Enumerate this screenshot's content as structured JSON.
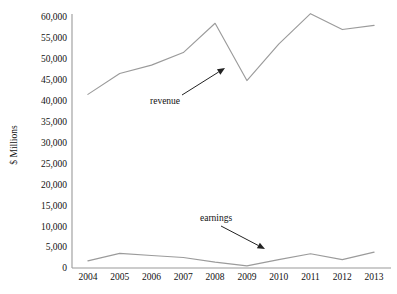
{
  "chart_data": {
    "type": "line",
    "title": "",
    "subtitle": "",
    "xlabel": "",
    "ylabel": "$ Millions",
    "categories": [
      "2004",
      "2005",
      "2006",
      "2007",
      "2008",
      "2009",
      "2010",
      "2011",
      "2012",
      "2013"
    ],
    "x": [
      2004,
      2005,
      2006,
      2007,
      2008,
      2009,
      2010,
      2011,
      2012,
      2013
    ],
    "series": [
      {
        "name": "revenue",
        "values": [
          41500,
          46500,
          48500,
          51500,
          58500,
          44800,
          53500,
          60800,
          57000,
          58000
        ],
        "color": "#9b9b9b"
      },
      {
        "name": "earnings",
        "values": [
          1700,
          3500,
          3000,
          2500,
          1400,
          500,
          2000,
          3400,
          2000,
          3800
        ],
        "color": "#9b9b9b"
      }
    ],
    "ylim": [
      0,
      60000
    ],
    "xlim": [
      2004,
      2013
    ],
    "yticks": [
      0,
      5000,
      10000,
      15000,
      20000,
      25000,
      30000,
      35000,
      40000,
      45000,
      50000,
      55000,
      60000
    ],
    "ytick_labels": [
      "0",
      "5,000",
      "10,000",
      "15,000",
      "20,000",
      "25,000",
      "30,000",
      "35,000",
      "40,000",
      "45,000",
      "50,000",
      "55,000",
      "60,000"
    ],
    "xtick_labels": [
      "2004",
      "2005",
      "2006",
      "2007",
      "2008",
      "2009",
      "2010",
      "2011",
      "2012",
      "2013"
    ],
    "grid": false,
    "legend": "none",
    "annotations": [
      {
        "text": "revenue",
        "label_x": 150,
        "label_y": 104,
        "arrow_from_x": 182,
        "arrow_from_y": 95,
        "arrow_to_x": 225,
        "arrow_to_y": 68
      },
      {
        "text": "earnings",
        "label_x": 200,
        "label_y": 221,
        "arrow_from_x": 221,
        "arrow_from_y": 226,
        "arrow_to_x": 265,
        "arrow_to_y": 249
      }
    ]
  },
  "axes": {
    "y_axis_title": "$ Millions",
    "plot_left": 72,
    "plot_right": 390,
    "plot_top": 17,
    "plot_bottom": 268
  }
}
